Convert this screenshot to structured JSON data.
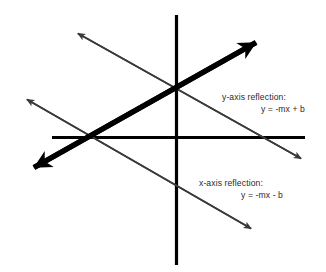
{
  "figure": {
    "background_color": "#ffffff",
    "axis_color": "#000000",
    "bold_line_color": "#000000",
    "thin_line_color": "#3a3a3a",
    "text_color": "#2b2b2b"
  },
  "axes": {
    "vertical": {
      "name": "y-axis",
      "x": 176,
      "y_start": 15,
      "y_end": 265,
      "thickness": 3
    },
    "horizontal": {
      "name": "x-axis",
      "y": 137,
      "x_start": 52,
      "x_end": 305,
      "thickness": 3
    }
  },
  "lines": [
    {
      "id": "original-line",
      "role": "original",
      "style": "bold",
      "thickness": 5,
      "arrowheads": "both",
      "slope_sign": "positive",
      "from": {
        "x": 18,
        "y": 176
      },
      "to": {
        "x": 272,
        "y": 34
      }
    },
    {
      "id": "y-axis-reflection-line",
      "role": "y-axis reflection",
      "style": "thin",
      "thickness": 1.4,
      "arrowheads": "both",
      "slope_sign": "negative",
      "from": {
        "x": 72,
        "y": 30
      },
      "to": {
        "x": 308,
        "y": 162
      }
    },
    {
      "id": "x-axis-reflection-line",
      "role": "x-axis reflection",
      "style": "thin",
      "thickness": 1.4,
      "arrowheads": "both",
      "slope_sign": "negative",
      "from": {
        "x": 21,
        "y": 96
      },
      "to": {
        "x": 258,
        "y": 232
      }
    }
  ],
  "labels": {
    "y_reflection": {
      "heading": "y-axis reflection:",
      "equation": "y = -mx + b"
    },
    "x_reflection": {
      "heading": "x-axis reflection:",
      "equation": "y = -mx - b"
    }
  }
}
